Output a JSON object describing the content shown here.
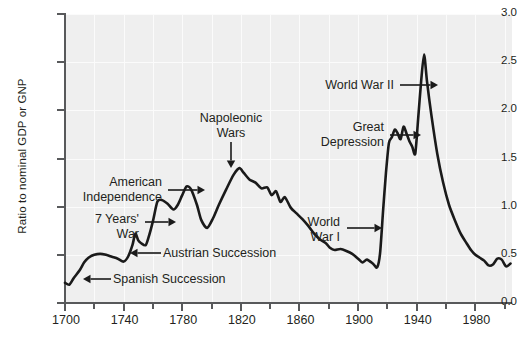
{
  "chart_data": {
    "type": "line",
    "title": "",
    "subtitle": "",
    "xlabel": "",
    "ylabel": "Ratio to nominal GDP or GNP",
    "xlim": [
      1700,
      2005
    ],
    "ylim": [
      0.0,
      3.0
    ],
    "grid": true,
    "legend": null,
    "y_ticks": [
      "0.0",
      "0.5",
      "1.0",
      "1.5",
      "2.0",
      "2.5",
      "3.0"
    ],
    "y_tick_values": [
      0.0,
      0.5,
      1.0,
      1.5,
      2.0,
      2.5,
      3.0
    ],
    "x_ticks": [
      "1700",
      "1740",
      "1780",
      "1820",
      "1860",
      "1900",
      "1940",
      "1980"
    ],
    "x_tick_values": [
      1700,
      1740,
      1780,
      1820,
      1860,
      1900,
      1940,
      1980
    ],
    "x_minor_tick_values": [
      1720,
      1760,
      1800,
      1840,
      1880,
      1920,
      1960,
      2000
    ],
    "series": [
      {
        "name": "UK public debt to GDP ratio",
        "color": "#1a1a1a",
        "x": [
          1700,
          1703,
          1706,
          1710,
          1713,
          1716,
          1720,
          1724,
          1728,
          1732,
          1736,
          1740,
          1743,
          1746,
          1748,
          1750,
          1752,
          1755,
          1757,
          1760,
          1763,
          1766,
          1770,
          1774,
          1777,
          1780,
          1783,
          1786,
          1790,
          1793,
          1797,
          1801,
          1805,
          1810,
          1815,
          1819,
          1822,
          1826,
          1830,
          1834,
          1838,
          1841,
          1844,
          1847,
          1850,
          1854,
          1858,
          1862,
          1866,
          1870,
          1874,
          1878,
          1881,
          1884,
          1888,
          1892,
          1896,
          1900,
          1903,
          1906,
          1910,
          1913,
          1915,
          1917,
          1919,
          1921,
          1923,
          1925,
          1927,
          1929,
          1931,
          1933,
          1935,
          1937,
          1939,
          1941,
          1943,
          1945,
          1947,
          1950,
          1954,
          1958,
          1962,
          1966,
          1970,
          1974,
          1977,
          1980,
          1983,
          1986,
          1989,
          1992,
          1995,
          1998,
          2001,
          2004
        ],
        "y": [
          0.21,
          0.19,
          0.26,
          0.34,
          0.42,
          0.47,
          0.5,
          0.51,
          0.5,
          0.48,
          0.46,
          0.43,
          0.48,
          0.6,
          0.72,
          0.65,
          0.62,
          0.6,
          0.68,
          0.85,
          1.05,
          1.07,
          1.03,
          0.97,
          1.02,
          1.12,
          1.21,
          1.18,
          1.02,
          0.86,
          0.78,
          0.88,
          1.02,
          1.18,
          1.33,
          1.4,
          1.35,
          1.28,
          1.25,
          1.19,
          1.2,
          1.12,
          1.16,
          1.05,
          1.1,
          0.99,
          0.93,
          0.87,
          0.8,
          0.72,
          0.66,
          0.62,
          0.57,
          0.55,
          0.56,
          0.54,
          0.51,
          0.46,
          0.42,
          0.45,
          0.41,
          0.37,
          0.52,
          0.95,
          1.35,
          1.66,
          1.72,
          1.8,
          1.76,
          1.7,
          1.83,
          1.76,
          1.68,
          1.62,
          1.55,
          1.92,
          2.3,
          2.58,
          2.3,
          1.95,
          1.55,
          1.25,
          1.02,
          0.86,
          0.72,
          0.62,
          0.55,
          0.5,
          0.47,
          0.44,
          0.39,
          0.4,
          0.46,
          0.45,
          0.38,
          0.41
        ]
      }
    ],
    "annotations": [
      {
        "id": "spanish-succession",
        "label": "Spanish Succession",
        "lines": [
          "Spanish Succession"
        ],
        "align": "left",
        "target_year": 1705,
        "target_value": 0.25
      },
      {
        "id": "seven-years-war",
        "label": "7 Years' War",
        "lines": [
          "7 Years'",
          "War"
        ],
        "align": "right",
        "target_year": 1760,
        "target_value": 0.9
      },
      {
        "id": "austrian-succession",
        "label": "Austrian Succession",
        "lines": [
          "Austrian Succession"
        ],
        "align": "left",
        "target_year": 1748,
        "target_value": 0.62
      },
      {
        "id": "american-independence",
        "label": "American Independence",
        "lines": [
          "American",
          "Independence"
        ],
        "align": "right",
        "target_year": 1783,
        "target_value": 1.18
      },
      {
        "id": "napoleonic-wars",
        "label": "Napoleonic Wars",
        "lines": [
          "Napoleonic",
          "Wars"
        ],
        "align": "center",
        "target_year": 1815,
        "target_value": 1.4
      },
      {
        "id": "world-war-i",
        "label": "World War I",
        "lines": [
          "World",
          "War I"
        ],
        "align": "right",
        "target_year": 1918,
        "target_value": 1.3
      },
      {
        "id": "great-depression",
        "label": "Great Depression",
        "lines": [
          "Great",
          "Depression"
        ],
        "align": "right",
        "target_year": 1931,
        "target_value": 1.83
      },
      {
        "id": "world-war-ii",
        "label": "World War II",
        "lines": [
          "World War II"
        ],
        "align": "right",
        "target_year": 1945,
        "target_value": 2.58
      }
    ]
  }
}
